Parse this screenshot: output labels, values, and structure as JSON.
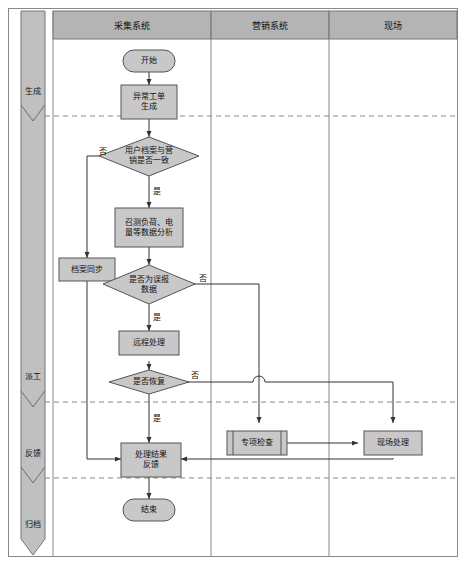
{
  "diagram": {
    "colors": {
      "node_fill": "#c8c8c8",
      "header_fill": "#b4b4b4",
      "band_fill": "#c0c0c0",
      "stroke": "#555555",
      "lane_line": "#888888",
      "dashed_line": "#888888",
      "text": "#111111",
      "page_bg": "#ffffff"
    },
    "lanes": [
      {
        "id": "lane-collection",
        "label": "采集系统"
      },
      {
        "id": "lane-marketing",
        "label": "营销系统"
      },
      {
        "id": "lane-field",
        "label": "现场"
      }
    ],
    "phases": [
      {
        "id": "phase-generate",
        "label": "生成"
      },
      {
        "id": "phase-dispatch",
        "label": "派工"
      },
      {
        "id": "phase-feedback",
        "label": "反馈"
      },
      {
        "id": "phase-archive",
        "label": "归档"
      }
    ],
    "nodes": [
      {
        "id": "start",
        "shape": "terminator",
        "label": "开始",
        "lane": "lane-collection"
      },
      {
        "id": "order-gen",
        "shape": "process",
        "label": "异常工单\n生成",
        "lane": "lane-collection"
      },
      {
        "id": "dec-profile",
        "shape": "decision",
        "label": "用户档案与营\n销是否一致",
        "lane": "lane-collection"
      },
      {
        "id": "data-analysis",
        "shape": "process",
        "label": "召测负荷、电\n量等数据分析",
        "lane": "lane-collection"
      },
      {
        "id": "archive-sync",
        "shape": "process",
        "label": "档案同步",
        "lane": "lane-collection"
      },
      {
        "id": "dec-false",
        "shape": "decision",
        "label": "是否为误报\n数据",
        "lane": "lane-collection"
      },
      {
        "id": "remote",
        "shape": "process",
        "label": "远程处理",
        "lane": "lane-collection"
      },
      {
        "id": "dec-recover",
        "shape": "decision",
        "label": "是否恢复",
        "lane": "lane-collection"
      },
      {
        "id": "special-chk",
        "shape": "predefined",
        "label": "专项检查",
        "lane": "lane-marketing"
      },
      {
        "id": "field-handle",
        "shape": "process",
        "label": "现场处理",
        "lane": "lane-field"
      },
      {
        "id": "result-fb",
        "shape": "process",
        "label": "处理结果\n反馈",
        "lane": "lane-collection"
      },
      {
        "id": "end",
        "shape": "terminator",
        "label": "结束",
        "lane": "lane-collection"
      }
    ],
    "edge_labels": [
      {
        "id": "edge-profile-no",
        "label": "否",
        "from": "dec-profile",
        "to": "archive-sync"
      },
      {
        "id": "edge-profile-yes",
        "label": "是",
        "from": "dec-profile",
        "to": "data-analysis"
      },
      {
        "id": "edge-false-no",
        "label": "否",
        "from": "dec-false",
        "to": "special-chk"
      },
      {
        "id": "edge-false-yes",
        "label": "是",
        "from": "dec-false",
        "to": "remote"
      },
      {
        "id": "edge-recover-no",
        "label": "否",
        "from": "dec-recover",
        "to": "field-handle"
      },
      {
        "id": "edge-recover-yes",
        "label": "是",
        "from": "dec-recover",
        "to": "result-fb"
      }
    ]
  }
}
